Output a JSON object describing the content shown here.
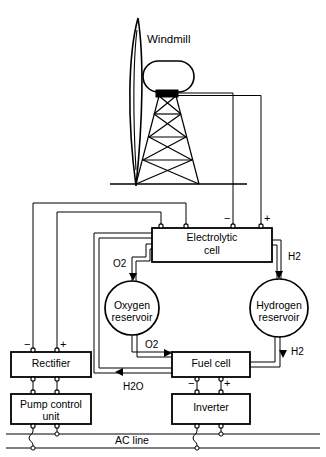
{
  "diagram": {
    "background_color": "#ffffff",
    "line_color": "#000000",
    "width": 326,
    "height": 457
  },
  "labels": {
    "windmill": "Windmill",
    "electrolytic_cell_line1": "Electrolytic",
    "electrolytic_cell_line2": "cell",
    "oxygen_reservoir_line1": "Oxygen",
    "oxygen_reservoir_line2": "reservoir",
    "hydrogen_reservoir_line1": "Hydrogen",
    "hydrogen_reservoir_line2": "reservoir",
    "rectifier": "Rectifier",
    "pump_control_unit_line1": "Pump control",
    "pump_control_unit_line2": "unit",
    "fuel_cell": "Fuel cell",
    "inverter": "Inverter",
    "ac_line": "AC line"
  },
  "gas_labels": {
    "o2_top": {
      "element": "O",
      "subscript": "2"
    },
    "o2_bottom": {
      "element": "O",
      "subscript": "2"
    },
    "h2_top": {
      "element": "H",
      "subscript": "2"
    },
    "h2_bottom": {
      "element": "H",
      "subscript": "2"
    },
    "h2o": {
      "element": "H",
      "subscript": "2",
      "element2": "O"
    }
  },
  "polarity_markers": {
    "electrolytic_cell_negative": "−",
    "electrolytic_cell_positive": "+",
    "rectifier_negative": "−",
    "rectifier_positive": "+",
    "fuel_cell_negative": "−",
    "fuel_cell_positive": "+"
  },
  "components": [
    {
      "name": "windmill",
      "type": "wind-turbine-on-lattice-tower"
    },
    {
      "name": "electrolytic-cell",
      "type": "box"
    },
    {
      "name": "oxygen-reservoir",
      "type": "circle"
    },
    {
      "name": "hydrogen-reservoir",
      "type": "circle"
    },
    {
      "name": "rectifier",
      "type": "box"
    },
    {
      "name": "pump-control-unit",
      "type": "box"
    },
    {
      "name": "fuel-cell",
      "type": "box"
    },
    {
      "name": "inverter",
      "type": "box"
    },
    {
      "name": "ac-line",
      "type": "bus"
    }
  ]
}
